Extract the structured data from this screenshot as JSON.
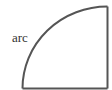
{
  "diagram": {
    "shape": "quarter-circle sector",
    "label": "arc",
    "stroke_color": "#555555",
    "edges": [
      "arc",
      "right-vertical-edge",
      "bottom-edge"
    ]
  }
}
